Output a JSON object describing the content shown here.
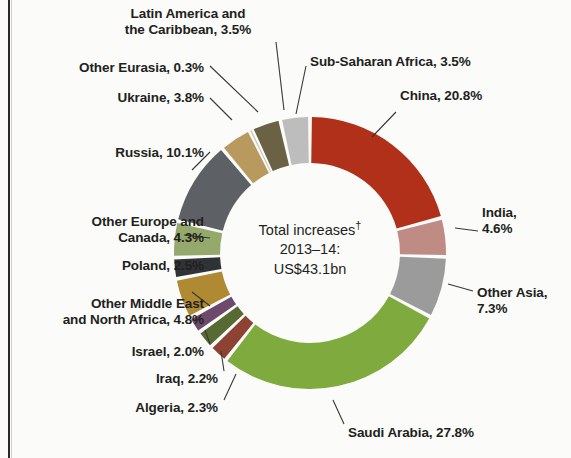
{
  "chart_data": {
    "type": "pie",
    "variant": "donut",
    "title": "",
    "center_label": {
      "line1": "Total increases",
      "dagger": "†",
      "line2": "2013–14:",
      "line3": "US$43.1bn"
    },
    "units": "percent of total increases",
    "total_value": "US$43.1bn",
    "legend": "labels placed around the ring with leader lines",
    "start_angle_deg": 0,
    "direction": "clockwise",
    "categories": [
      "China",
      "India",
      "Other Asia",
      "Saudi Arabia",
      "Algeria",
      "Iraq",
      "Israel",
      "Other Middle East and North Africa",
      "Poland",
      "Other Europe and Canada",
      "Russia",
      "Ukraine",
      "Other Eurasia",
      "Latin America and the Caribbean",
      "Sub-Saharan Africa"
    ],
    "values": [
      20.8,
      4.6,
      7.3,
      27.8,
      2.3,
      2.2,
      2.0,
      4.8,
      2.5,
      4.3,
      10.1,
      3.8,
      0.3,
      3.5,
      3.5
    ],
    "colors": [
      "#b0301a",
      "#bf8b85",
      "#9b9b9b",
      "#7faa3e",
      "#8e4231",
      "#586a34",
      "#6d4a6c",
      "#b08a33",
      "#2f3338",
      "#95a96c",
      "#5d6165",
      "#b89a5e",
      "#c9c6be",
      "#6b6144",
      "#bdbdbd"
    ],
    "labels": [
      {
        "name": "China",
        "text": "China, 20.8%",
        "value": 20.8,
        "color": "#b0301a"
      },
      {
        "name": "India",
        "text": "India,\n4.6%",
        "value": 4.6,
        "color": "#bf8b85"
      },
      {
        "name": "Other Asia",
        "text": "Other Asia,\n7.3%",
        "value": 7.3,
        "color": "#9b9b9b"
      },
      {
        "name": "Saudi Arabia",
        "text": "Saudi Arabia, 27.8%",
        "value": 27.8,
        "color": "#7faa3e"
      },
      {
        "name": "Algeria",
        "text": "Algeria, 2.3%",
        "value": 2.3,
        "color": "#8e4231"
      },
      {
        "name": "Iraq",
        "text": "Iraq, 2.2%",
        "value": 2.2,
        "color": "#586a34"
      },
      {
        "name": "Israel",
        "text": "Israel, 2.0%",
        "value": 2.0,
        "color": "#6d4a6c"
      },
      {
        "name": "Other Middle East and North Africa",
        "text": "Other Middle East\nand North Africa, 4.8%",
        "value": 4.8,
        "color": "#b08a33"
      },
      {
        "name": "Poland",
        "text": "Poland, 2.5%",
        "value": 2.5,
        "color": "#2f3338"
      },
      {
        "name": "Other Europe and Canada",
        "text": "Other Europe and\nCanada, 4.3%",
        "value": 4.3,
        "color": "#95a96c"
      },
      {
        "name": "Russia",
        "text": "Russia, 10.1%",
        "value": 10.1,
        "color": "#5d6165"
      },
      {
        "name": "Ukraine",
        "text": "Ukraine, 3.8%",
        "value": 3.8,
        "color": "#b89a5e"
      },
      {
        "name": "Other Eurasia",
        "text": "Other Eurasia, 0.3%",
        "value": 0.3,
        "color": "#c9c6be"
      },
      {
        "name": "Latin America and the Caribbean",
        "text": "Latin America and\nthe Caribbean, 3.5%",
        "value": 3.5,
        "color": "#6b6144"
      },
      {
        "name": "Sub-Saharan Africa",
        "text": "Sub-Saharan Africa, 3.5%",
        "value": 3.5,
        "color": "#bdbdbd"
      }
    ]
  },
  "geometry": {
    "cx": 310,
    "cy": 253,
    "outer_r": 136,
    "inner_r": 90,
    "gap_deg": 1.6
  },
  "label_positions": [
    {
      "key": "China",
      "x": 400,
      "y": 88,
      "w": 160,
      "align": "left",
      "lx1": 396,
      "ly1": 112,
      "lx2": 372,
      "ly2": 137
    },
    {
      "key": "India",
      "x": 482,
      "y": 205,
      "w": 85,
      "align": "left",
      "lx1": 478,
      "ly1": 231,
      "lx2": 455,
      "ly2": 228
    },
    {
      "key": "Other Asia",
      "x": 477,
      "y": 285,
      "w": 94,
      "align": "left",
      "lx1": 473,
      "ly1": 291,
      "lx2": 448,
      "ly2": 284
    },
    {
      "key": "Saudi Arabia",
      "x": 348,
      "y": 425,
      "w": 170,
      "align": "left",
      "lx1": 344,
      "ly1": 424,
      "lx2": 333,
      "ly2": 400
    },
    {
      "key": "Algeria",
      "x": 52,
      "y": 400,
      "w": 166,
      "align": "right",
      "lx1": 224,
      "ly1": 400,
      "lx2": 236,
      "ly2": 374
    },
    {
      "key": "Iraq",
      "x": 62,
      "y": 371,
      "w": 156,
      "align": "right",
      "lx1": 224,
      "ly1": 371,
      "lx2": 221,
      "ly2": 351
    },
    {
      "key": "Israel",
      "x": 44,
      "y": 344,
      "w": 160,
      "align": "right",
      "lx1": 210,
      "ly1": 344,
      "lx2": 205,
      "ly2": 330
    },
    {
      "key": "Other Middle East and North Africa",
      "x": 12,
      "y": 296,
      "w": 192,
      "align": "right",
      "lx1": 210,
      "ly1": 306,
      "lx2": 192,
      "ly2": 292
    },
    {
      "key": "Poland",
      "x": 46,
      "y": 258,
      "w": 158,
      "align": "right",
      "lx1": 210,
      "ly1": 265,
      "lx2": 186,
      "ly2": 262
    },
    {
      "key": "Other Europe and Canada",
      "x": 22,
      "y": 214,
      "w": 182,
      "align": "right",
      "lx1": 210,
      "ly1": 238,
      "lx2": 184,
      "ly2": 235
    },
    {
      "key": "Russia",
      "x": 48,
      "y": 145,
      "w": 156,
      "align": "right",
      "lx1": 210,
      "ly1": 152,
      "lx2": 192,
      "ly2": 170
    },
    {
      "key": "Ukraine",
      "x": 48,
      "y": 90,
      "w": 156,
      "align": "right",
      "lx1": 210,
      "ly1": 98,
      "lx2": 232,
      "ly2": 120
    },
    {
      "key": "Other Eurasia",
      "x": 34,
      "y": 60,
      "w": 170,
      "align": "right",
      "lx1": 210,
      "ly1": 66,
      "lx2": 258,
      "ly2": 112
    },
    {
      "key": "Latin America and the Caribbean",
      "x": 96,
      "y": 6,
      "w": 184,
      "align": "center",
      "lx1": 276,
      "ly1": 42,
      "lx2": 284,
      "ly2": 110
    },
    {
      "key": "Sub-Saharan Africa",
      "x": 310,
      "y": 54,
      "w": 200,
      "align": "left",
      "lx1": 306,
      "ly1": 66,
      "lx2": 296,
      "ly2": 114
    }
  ]
}
